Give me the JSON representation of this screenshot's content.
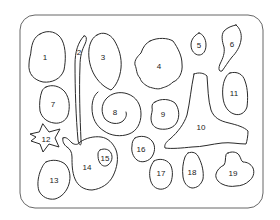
{
  "diagram": {
    "type": "numbered-shapes-sheet",
    "frame": {
      "x": 20,
      "y": 15,
      "width": 243,
      "height": 193,
      "radius": 15,
      "stroke": "#555555"
    },
    "stroke_color": "#2a2a2a",
    "shapes": [
      {
        "id": 1,
        "label": "1",
        "lx": 45,
        "ly": 57
      },
      {
        "id": 2,
        "label": "2",
        "lx": 79,
        "ly": 52
      },
      {
        "id": 3,
        "label": "3",
        "lx": 103,
        "ly": 57
      },
      {
        "id": 4,
        "label": "4",
        "lx": 159,
        "ly": 66
      },
      {
        "id": 5,
        "label": "5",
        "lx": 199,
        "ly": 45
      },
      {
        "id": 6,
        "label": "6",
        "lx": 232,
        "ly": 44
      },
      {
        "id": 7,
        "label": "7",
        "lx": 53,
        "ly": 104
      },
      {
        "id": 8,
        "label": "8",
        "lx": 115,
        "ly": 112
      },
      {
        "id": 9,
        "label": "9",
        "lx": 163,
        "ly": 114
      },
      {
        "id": 10,
        "label": "10",
        "lx": 201,
        "ly": 127
      },
      {
        "id": 11,
        "label": "11",
        "lx": 234,
        "ly": 93
      },
      {
        "id": 12,
        "label": "12",
        "lx": 46,
        "ly": 139
      },
      {
        "id": 13,
        "label": "13",
        "lx": 54,
        "ly": 180
      },
      {
        "id": 14,
        "label": "14",
        "lx": 87,
        "ly": 167
      },
      {
        "id": 15,
        "label": "15",
        "lx": 105,
        "ly": 158
      },
      {
        "id": 16,
        "label": "16",
        "lx": 141,
        "ly": 149
      },
      {
        "id": 17,
        "label": "17",
        "lx": 161,
        "ly": 173
      },
      {
        "id": 18,
        "label": "18",
        "lx": 192,
        "ly": 172
      },
      {
        "id": 19,
        "label": "19",
        "lx": 233,
        "ly": 173
      }
    ]
  }
}
